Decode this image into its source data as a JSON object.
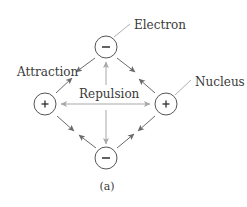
{
  "labels": {
    "electron": "Electron",
    "nucleus": "Nucleus",
    "attraction": "Attraction",
    "repulsion": "Repulsion",
    "caption": "(a)"
  },
  "particles": {
    "top_electron": {
      "symbol": "–",
      "type": "electron"
    },
    "bottom_electron": {
      "symbol": "–",
      "type": "electron"
    },
    "left_nucleus": {
      "symbol": "+",
      "type": "nucleus"
    },
    "right_nucleus": {
      "symbol": "+",
      "type": "nucleus"
    }
  },
  "colors": {
    "attraction_arrow": "#6a6a6a",
    "repulsion_arrow": "#a8a8a8",
    "circle_stroke": "#555555",
    "text": "#3a3a3a",
    "leader_line": "#b0b0b0"
  }
}
